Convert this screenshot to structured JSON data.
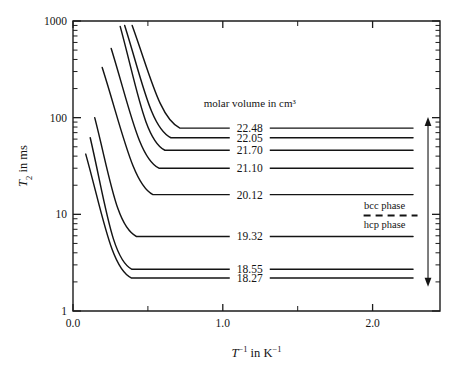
{
  "chart_data": {
    "type": "line",
    "title": "",
    "xlabel": "T⁻¹ in K⁻¹",
    "ylabel": "T₂ in ms",
    "xlim": [
      0.0,
      2.45
    ],
    "ylim": [
      1,
      1000
    ],
    "yscale": "log",
    "xscale": "linear",
    "grid": false,
    "legend_position": "inside-right",
    "legend_title": "molar volume in cm³",
    "xticks": [
      "0.0",
      "1.0",
      "2.0"
    ],
    "xtick_values": [
      0.0,
      1.0,
      2.0
    ],
    "xminor_values": [
      0.5,
      1.5
    ],
    "yticks": [
      "1",
      "10",
      "100",
      "1000"
    ],
    "ytick_values": [
      1,
      10,
      100,
      1000
    ],
    "annotations": [
      {
        "text": "bcc phase",
        "x": 2.08,
        "y": 12.5
      },
      {
        "text": "hcp phase",
        "x": 2.08,
        "y": 8.0
      }
    ],
    "phase_divider": {
      "style": "dashed",
      "y": 9.7,
      "x_from": 1.94,
      "x_to": 2.3
    },
    "phase_arrow": {
      "style": "double-headed",
      "x": 2.37,
      "y_top": 88,
      "y_bottom": 2.05
    },
    "series": [
      {
        "name": "22.48",
        "plateau": 78.0,
        "knee_x": 0.62,
        "start_x": 0.395,
        "start_y": 900,
        "phase": "bcc"
      },
      {
        "name": "22.05",
        "plateau": 62.0,
        "knee_x": 0.56,
        "start_x": 0.345,
        "start_y": 900,
        "phase": "bcc"
      },
      {
        "name": "21.70",
        "plateau": 46.0,
        "knee_x": 0.52,
        "start_x": 0.315,
        "start_y": 880,
        "phase": "bcc"
      },
      {
        "name": "21.10",
        "plateau": 30.0,
        "knee_x": 0.48,
        "start_x": 0.255,
        "start_y": 520,
        "phase": "bcc"
      },
      {
        "name": "20.12",
        "plateau": 16.0,
        "knee_x": 0.44,
        "start_x": 0.195,
        "start_y": 330,
        "phase": "bcc"
      },
      {
        "name": "19.32",
        "plateau": 5.9,
        "knee_x": 0.33,
        "start_x": 0.145,
        "start_y": 100,
        "phase": "hcp"
      },
      {
        "name": "18.55",
        "plateau": 2.7,
        "knee_x": 0.3,
        "start_x": 0.115,
        "start_y": 62,
        "phase": "hcp"
      },
      {
        "name": "18.27",
        "plateau": 2.2,
        "knee_x": 0.295,
        "start_x": 0.085,
        "start_y": 42,
        "phase": "hcp"
      }
    ],
    "label_anchor_x": 1.18,
    "label_leader_left_from": 0.8,
    "label_leader_right_to": 2.27
  }
}
